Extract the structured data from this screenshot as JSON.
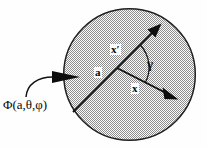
{
  "figure": {
    "canvas": {
      "width": 207,
      "height": 149,
      "background": "#fefefe"
    },
    "sphere": {
      "name": "stippled-sphere",
      "cx": 129.5,
      "cy": 74.5,
      "r": 66.5,
      "fill_pattern": "stipple-dots",
      "fill_color": "#b9b9b9",
      "stroke_color": "#1a1a1a",
      "stroke_width": 1.4
    },
    "vectors": [
      {
        "name": "radius-a",
        "label": "a",
        "from": [
          117,
          68
        ],
        "to": [
          74,
          111
        ],
        "arrow": false
      },
      {
        "name": "vector-x-prime",
        "label": "x'",
        "from": [
          117,
          68
        ],
        "to": [
          159,
          26
        ],
        "arrow": true
      },
      {
        "name": "vector-x",
        "label": "x",
        "from": [
          117,
          68
        ],
        "to": [
          176,
          98
        ],
        "arrow": true
      }
    ],
    "angle_arc": {
      "name": "angle-gamma",
      "label": "γ",
      "cx": 117,
      "cy": 68,
      "radius": 33
    },
    "incident_field": {
      "name": "incident-field-pointer",
      "label": "Φ(a,θ,φ)",
      "curve_from": [
        26,
        97
      ],
      "curve_to": [
        55,
        77
      ],
      "arrow_tip": [
        80,
        77
      ]
    },
    "labels": {
      "phi": "Φ(a,θ,φ)",
      "radius": "a",
      "x_prime": "x′",
      "x": "x",
      "gamma": "γ"
    },
    "colors": {
      "ink": "#0a0a0a",
      "stipple": "#b4b4b4",
      "paper": "#fefefe"
    }
  }
}
